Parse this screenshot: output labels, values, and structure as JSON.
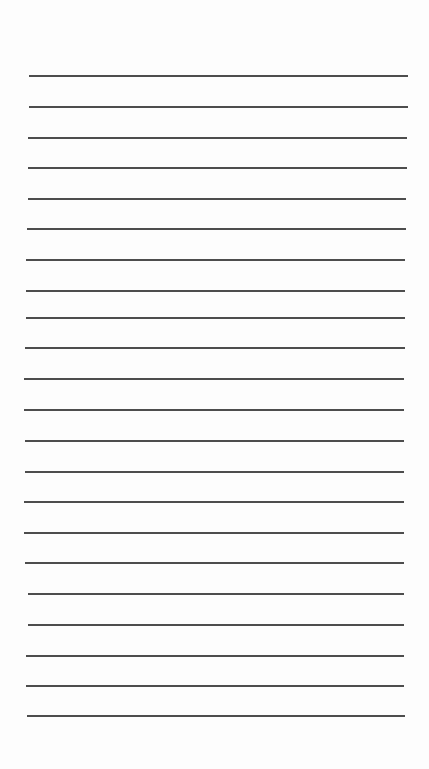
{
  "document": {
    "type": "lined-paper",
    "background_color": "#fdfdfd",
    "rule_color": "#3a3a3a",
    "rules": [
      {
        "y": 75,
        "x1": 29,
        "x2": 408
      },
      {
        "y": 106,
        "x1": 29,
        "x2": 408
      },
      {
        "y": 137,
        "x1": 28,
        "x2": 407
      },
      {
        "y": 167,
        "x1": 28,
        "x2": 407
      },
      {
        "y": 198,
        "x1": 28,
        "x2": 406
      },
      {
        "y": 228,
        "x1": 27,
        "x2": 406
      },
      {
        "y": 259,
        "x1": 26,
        "x2": 405
      },
      {
        "y": 290,
        "x1": 26,
        "x2": 405
      },
      {
        "y": 317,
        "x1": 26,
        "x2": 405
      },
      {
        "y": 347,
        "x1": 25,
        "x2": 405
      },
      {
        "y": 378,
        "x1": 24,
        "x2": 404
      },
      {
        "y": 409,
        "x1": 24,
        "x2": 404
      },
      {
        "y": 440,
        "x1": 25,
        "x2": 404
      },
      {
        "y": 471,
        "x1": 25,
        "x2": 404
      },
      {
        "y": 501,
        "x1": 24,
        "x2": 404
      },
      {
        "y": 532,
        "x1": 24,
        "x2": 404
      },
      {
        "y": 562,
        "x1": 25,
        "x2": 404
      },
      {
        "y": 593,
        "x1": 28,
        "x2": 404
      },
      {
        "y": 624,
        "x1": 28,
        "x2": 404
      },
      {
        "y": 655,
        "x1": 26,
        "x2": 404
      },
      {
        "y": 685,
        "x1": 26,
        "x2": 404
      },
      {
        "y": 715,
        "x1": 27,
        "x2": 405
      }
    ]
  }
}
